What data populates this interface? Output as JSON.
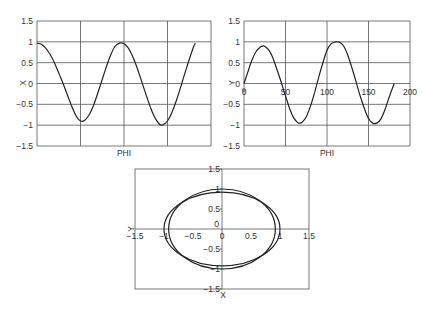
{
  "chart_data": [
    {
      "type": "line",
      "title": "",
      "xlabel": "PHI",
      "ylabel": "X",
      "xlim": [
        0,
        200
      ],
      "ylim": [
        -1.5,
        1.5
      ],
      "yticks": [
        "1.5",
        "1",
        "0.5",
        "0",
        "-0.5",
        "-1",
        "-1.5"
      ],
      "xticks": [],
      "grid": true,
      "series": [
        {
          "name": "X",
          "x": [
            0,
            5,
            10,
            15,
            20,
            25,
            30,
            35,
            40,
            45,
            50,
            55,
            60,
            65,
            70,
            75,
            80,
            85,
            90,
            95,
            98,
            100,
            105,
            110,
            115,
            120,
            125,
            130,
            135,
            140,
            143,
            145,
            150,
            155,
            160,
            165,
            170,
            175,
            180,
            182
          ],
          "y": [
            0.97,
            0.94,
            0.85,
            0.7,
            0.5,
            0.25,
            0.0,
            -0.28,
            -0.55,
            -0.78,
            -0.9,
            -0.88,
            -0.75,
            -0.52,
            -0.22,
            0.1,
            0.42,
            0.7,
            0.9,
            0.97,
            0.97,
            0.96,
            0.85,
            0.65,
            0.38,
            0.07,
            -0.25,
            -0.55,
            -0.8,
            -0.96,
            -1.0,
            -0.99,
            -0.9,
            -0.7,
            -0.42,
            -0.1,
            0.25,
            0.58,
            0.88,
            0.97
          ]
        }
      ]
    },
    {
      "type": "line",
      "title": "",
      "xlabel": "PHI",
      "ylabel": "Y",
      "xlim": [
        0,
        200
      ],
      "ylim": [
        -1.5,
        1.5
      ],
      "yticks": [
        "1.5",
        "1",
        "0.5",
        "0",
        "-0.5",
        "-1",
        "-1.5"
      ],
      "xticks": [
        "0",
        "50",
        "100",
        "150",
        "200"
      ],
      "grid": true,
      "series": [
        {
          "name": "Y",
          "x": [
            0,
            5,
            10,
            15,
            20,
            23,
            25,
            30,
            35,
            40,
            45,
            50,
            55,
            60,
            65,
            67,
            70,
            75,
            80,
            85,
            90,
            95,
            100,
            105,
            110,
            113,
            115,
            120,
            125,
            130,
            135,
            140,
            145,
            150,
            155,
            160,
            165,
            170,
            175,
            181
          ],
          "y": [
            0.0,
            0.3,
            0.58,
            0.78,
            0.88,
            0.9,
            0.89,
            0.8,
            0.6,
            0.32,
            0.02,
            -0.3,
            -0.6,
            -0.83,
            -0.94,
            -0.95,
            -0.93,
            -0.8,
            -0.55,
            -0.22,
            0.15,
            0.5,
            0.8,
            0.95,
            1.0,
            1.0,
            0.99,
            0.9,
            0.68,
            0.38,
            0.04,
            -0.3,
            -0.6,
            -0.84,
            -0.95,
            -0.95,
            -0.85,
            -0.62,
            -0.32,
            0.0
          ]
        }
      ]
    },
    {
      "type": "line",
      "title": "",
      "xlabel": "X",
      "ylabel": "Y",
      "xlim": [
        -1.5,
        1.5
      ],
      "ylim": [
        -1.5,
        1.5
      ],
      "xticks": [
        "-1.5",
        "-1",
        "-0.5",
        "0",
        "0.5",
        "1",
        "1.5"
      ],
      "yticks": [
        "1.5",
        "1",
        "0.5",
        "0",
        "-0.5",
        "-1",
        "-1.5"
      ],
      "grid": false,
      "series": [
        {
          "name": "orbit-outer",
          "shape": "ellipse",
          "rx": 1.0,
          "ry": 0.92
        },
        {
          "name": "orbit-inner",
          "shape": "ellipse",
          "rx": 0.92,
          "ry": 1.0
        }
      ]
    }
  ],
  "labels": {
    "left_xlabel": "PHI",
    "left_ylabel": "X",
    "right_xlabel": "PHI",
    "right_ylabel": "Y",
    "bottom_xlabel": "X",
    "bottom_ylabel": "Y"
  }
}
